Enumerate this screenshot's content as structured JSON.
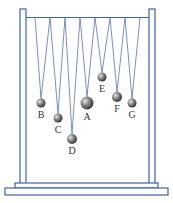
{
  "diagram": {
    "title": "",
    "colors": {
      "frame": "#3f63a6",
      "frame_fill": "#ffffff",
      "string": "#6a85b8",
      "ball_dark": "#3a3a3a",
      "ball_light": "#d8d8d8"
    },
    "pendulums": [
      {
        "label": "B",
        "anchors": [
          35,
          50
        ],
        "x": 41,
        "y": 103,
        "r": 4.5
      },
      {
        "label": "C",
        "anchors": [
          50,
          65
        ],
        "x": 58,
        "y": 118,
        "r": 4.5
      },
      {
        "label": "D",
        "anchors": [
          65,
          80
        ],
        "x": 72,
        "y": 139,
        "r": 5
      },
      {
        "label": "A",
        "anchors": [
          80,
          95
        ],
        "x": 87,
        "y": 103,
        "r": 6.5
      },
      {
        "label": "E",
        "anchors": [
          95,
          110
        ],
        "x": 102,
        "y": 77,
        "r": 4.5
      },
      {
        "label": "F",
        "anchors": [
          110,
          125
        ],
        "x": 117,
        "y": 97,
        "r": 5
      },
      {
        "label": "G",
        "anchors": [
          125,
          140
        ],
        "x": 132,
        "y": 103,
        "r": 4.5
      }
    ]
  }
}
